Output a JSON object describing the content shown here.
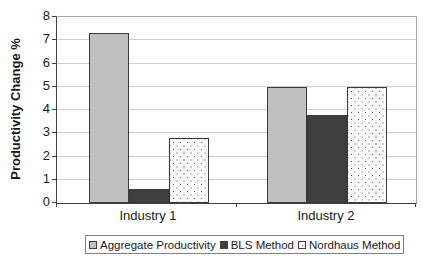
{
  "chart_data": {
    "type": "bar",
    "categories": [
      "Industry 1",
      "Industry 2"
    ],
    "series": [
      {
        "name": "Aggregate Productivity",
        "values": [
          7.3,
          5.0
        ],
        "fill": "silver"
      },
      {
        "name": "BLS Method",
        "values": [
          0.6,
          3.8
        ],
        "fill": "dark"
      },
      {
        "name": "Nordhaus Method",
        "values": [
          2.8,
          5.0
        ],
        "fill": "dotted"
      }
    ],
    "title": "",
    "xlabel": "",
    "ylabel": "Productivity Change %",
    "ylim": [
      0,
      8
    ],
    "yticks": [
      0,
      1,
      2,
      3,
      4,
      5,
      6,
      7,
      8
    ],
    "grid": true,
    "legend_position": "bottom"
  },
  "colors": {
    "bar_silver": "#c0c0c0",
    "bar_dark": "#3f3f3f",
    "dotted_dot": "#4a4a4a",
    "gridline": "#cfcfcf",
    "axis": "#404040",
    "frame": "#a8a8a8",
    "text": "#1a1a1a"
  }
}
